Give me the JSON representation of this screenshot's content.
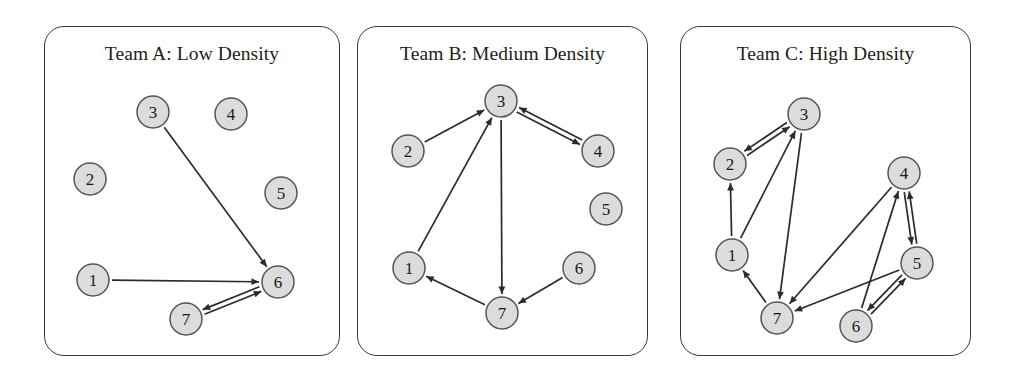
{
  "figure": {
    "caption": "",
    "background_color": "#ffffff",
    "node_fill": "#dcdcdc",
    "node_stroke": "#555555",
    "edge_color": "#2b2b2b",
    "panel_border_color": "#3a3a3a"
  },
  "chart_data": {
    "type": "diagram",
    "subtype": "directed-network-graph",
    "title": "",
    "panel_count": 3,
    "node_count_per_panel": 7,
    "panels": [
      {
        "id": "a",
        "title": "Team A: Low Density",
        "team": "A",
        "density_label": "Low Density",
        "edge_count": 3,
        "nodes": [
          {
            "id": "1",
            "label": "1",
            "x": 92,
            "y": 279
          },
          {
            "id": "2",
            "label": "2",
            "x": 89,
            "y": 178
          },
          {
            "id": "3",
            "label": "3",
            "x": 152,
            "y": 111
          },
          {
            "id": "4",
            "label": "4",
            "x": 230,
            "y": 113
          },
          {
            "id": "5",
            "label": "5",
            "x": 280,
            "y": 192
          },
          {
            "id": "6",
            "label": "6",
            "x": 277,
            "y": 281
          },
          {
            "id": "7",
            "label": "7",
            "x": 185,
            "y": 318
          }
        ],
        "edges": [
          {
            "from": "3",
            "to": "6",
            "directed": true,
            "bidirectional": false
          },
          {
            "from": "1",
            "to": "6",
            "directed": true,
            "bidirectional": false
          },
          {
            "from": "6",
            "to": "7",
            "directed": true,
            "bidirectional": true
          }
        ],
        "isolated_nodes": [
          "2",
          "4",
          "5"
        ]
      },
      {
        "id": "b",
        "title": "Team B: Medium Density",
        "team": "B",
        "density_label": "Medium Density",
        "edge_count": 6,
        "nodes": [
          {
            "id": "1",
            "label": "1",
            "x": 408,
            "y": 267
          },
          {
            "id": "2",
            "label": "2",
            "x": 407,
            "y": 150
          },
          {
            "id": "3",
            "label": "3",
            "x": 500,
            "y": 100
          },
          {
            "id": "4",
            "label": "4",
            "x": 597,
            "y": 150
          },
          {
            "id": "5",
            "label": "5",
            "x": 605,
            "y": 208
          },
          {
            "id": "6",
            "label": "6",
            "x": 578,
            "y": 267
          },
          {
            "id": "7",
            "label": "7",
            "x": 501,
            "y": 312
          }
        ],
        "edges": [
          {
            "from": "2",
            "to": "3",
            "directed": true,
            "bidirectional": false
          },
          {
            "from": "1",
            "to": "3",
            "directed": true,
            "bidirectional": false
          },
          {
            "from": "3",
            "to": "4",
            "directed": true,
            "bidirectional": true
          },
          {
            "from": "3",
            "to": "7",
            "directed": true,
            "bidirectional": false
          },
          {
            "from": "7",
            "to": "1",
            "directed": true,
            "bidirectional": false
          },
          {
            "from": "6",
            "to": "7",
            "directed": true,
            "bidirectional": false
          }
        ],
        "isolated_nodes": [
          "5"
        ]
      },
      {
        "id": "c",
        "title": "Team C: High Density",
        "team": "C",
        "density_label": "High Density",
        "edge_count": 9,
        "nodes": [
          {
            "id": "1",
            "label": "1",
            "x": 731,
            "y": 254
          },
          {
            "id": "2",
            "label": "2",
            "x": 729,
            "y": 163
          },
          {
            "id": "3",
            "label": "3",
            "x": 803,
            "y": 113
          },
          {
            "id": "4",
            "label": "4",
            "x": 903,
            "y": 172
          },
          {
            "id": "5",
            "label": "5",
            "x": 916,
            "y": 262
          },
          {
            "id": "6",
            "label": "6",
            "x": 855,
            "y": 325
          },
          {
            "id": "7",
            "label": "7",
            "x": 776,
            "y": 317
          }
        ],
        "edges": [
          {
            "from": "2",
            "to": "3",
            "directed": true,
            "bidirectional": true
          },
          {
            "from": "1",
            "to": "2",
            "directed": true,
            "bidirectional": false
          },
          {
            "from": "1",
            "to": "3",
            "directed": true,
            "bidirectional": false
          },
          {
            "from": "3",
            "to": "7",
            "directed": true,
            "bidirectional": false
          },
          {
            "from": "7",
            "to": "1",
            "directed": true,
            "bidirectional": false
          },
          {
            "from": "4",
            "to": "5",
            "directed": true,
            "bidirectional": true
          },
          {
            "from": "4",
            "to": "7",
            "directed": true,
            "bidirectional": false
          },
          {
            "from": "5",
            "to": "7",
            "directed": true,
            "bidirectional": false
          },
          {
            "from": "5",
            "to": "6",
            "directed": true,
            "bidirectional": true
          },
          {
            "from": "6",
            "to": "4",
            "directed": true,
            "bidirectional": false
          }
        ],
        "isolated_nodes": []
      }
    ]
  }
}
